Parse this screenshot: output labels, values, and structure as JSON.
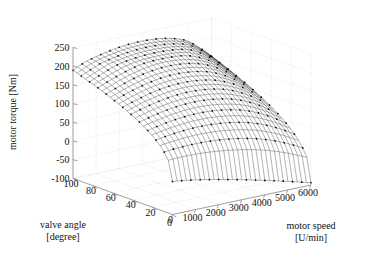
{
  "chart_data": {
    "type": "surface",
    "title": "",
    "xlabel": "motor speed",
    "xunit": "[U/min]",
    "ylabel": "valve angle",
    "yunit": "[degree]",
    "zlabel": "motor torque [Nm]",
    "x_ticks": [
      0,
      1000,
      2000,
      3000,
      4000,
      5000,
      6000
    ],
    "y_ticks": [
      100,
      80,
      60,
      40,
      20,
      0
    ],
    "z_ticks": [
      -100,
      -50,
      0,
      50,
      100,
      150,
      200,
      250
    ],
    "xlim": [
      0,
      6000
    ],
    "ylim": [
      0,
      100
    ],
    "zlim": [
      -100,
      250
    ],
    "grid": true,
    "legend": null,
    "mesh_color": "#3a3a3a",
    "marker_color": "#000000",
    "grid_color": "#cfcfcf",
    "axis_color": "#8a8a8a",
    "series_name": "engine torque map",
    "surface_nx": 31,
    "surface_ny": 25,
    "surface_description": "Motor torque rises with valve angle, saturating near 230 Nm at high valve angle and mid speed; falls steeply to about -90 Nm at closed valve angle (0 degree) and high motor speed.",
    "z_at_corners": {
      "speed0_angle0": 0,
      "speed0_angle100": 175,
      "speed6000_angle0": -90,
      "speed6000_angle100": 205
    },
    "surface_peak": {
      "speed": 2600,
      "angle": 100,
      "torque": 232
    }
  },
  "axis_titles": {
    "z": "motor torque [Nm]",
    "y_line1": "valve angle",
    "y_line2": "[degree]",
    "x_line1": "motor speed",
    "x_line2": "[U/min]"
  }
}
